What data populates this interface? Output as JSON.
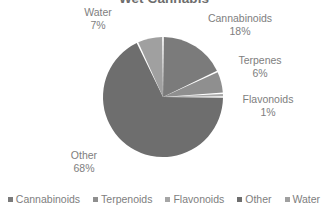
{
  "chart_data": {
    "type": "pie",
    "title": "Wet Cannabis",
    "categories": [
      "Cannabinoids",
      "Terpenoids",
      "Flavonoids",
      "Other",
      "Water"
    ],
    "values": [
      18,
      6,
      1,
      68,
      7
    ],
    "value_unit": "%",
    "slice_labels": [
      {
        "name": "Cannabinoids",
        "pct": "18%"
      },
      {
        "name": "Terpenes",
        "pct": "6%"
      },
      {
        "name": "Flavonoids",
        "pct": "1%"
      },
      {
        "name": "Other",
        "pct": "68%"
      },
      {
        "name": "Water",
        "pct": "7%"
      }
    ],
    "colors": [
      "#7b7b7b",
      "#8f8f8f",
      "#a6a6a6",
      "#6e6e6e",
      "#a0a0a0"
    ],
    "separator_color": "#ffffff",
    "start_angle_deg": 0,
    "direction": "clockwise",
    "legend_position": "bottom",
    "grid": false
  },
  "legend": {
    "items": [
      {
        "label": "Cannabinoids",
        "color": "#7b7b7b"
      },
      {
        "label": "Terpenoids",
        "color": "#8f8f8f"
      },
      {
        "label": "Flavonoids",
        "color": "#a6a6a6"
      },
      {
        "label": "Other",
        "color": "#6e6e6e"
      },
      {
        "label": "Water",
        "color": "#a0a0a0"
      }
    ]
  }
}
